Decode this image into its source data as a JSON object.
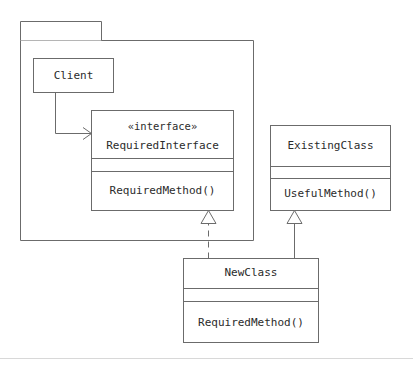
{
  "diagram": {
    "kind": "uml-class-diagram",
    "stroke_color": "#6b6b6b",
    "fill_color": "#ffffff",
    "text_color": "#2b2b2b",
    "footer_rule_color": "#d8d8d8"
  },
  "package": {
    "name": "",
    "tab_label": ""
  },
  "classes": {
    "client": {
      "name": "Client",
      "compartments": []
    },
    "required_interface": {
      "stereotype": "«interface»",
      "name": "RequiredInterface",
      "attributes": "",
      "operations": "RequiredMethod()"
    },
    "existing_class": {
      "name": "ExistingClass",
      "attributes": "",
      "operations": "UsefulMethod()"
    },
    "new_class": {
      "name": "NewClass",
      "attributes": "",
      "operations": "RequiredMethod()"
    }
  },
  "relationships": [
    {
      "id": "client-uses-interface",
      "type": "association",
      "line_style": "solid",
      "arrow": "open",
      "from": "Client",
      "to": "RequiredInterface",
      "label": ""
    },
    {
      "id": "newclass-realizes-interface",
      "type": "realization",
      "line_style": "dashed",
      "arrow": "hollow-triangle",
      "from": "NewClass",
      "to": "RequiredInterface",
      "label": ""
    },
    {
      "id": "newclass-extends-existingclass",
      "type": "generalization",
      "line_style": "solid",
      "arrow": "hollow-triangle",
      "from": "NewClass",
      "to": "ExistingClass",
      "label": ""
    }
  ]
}
